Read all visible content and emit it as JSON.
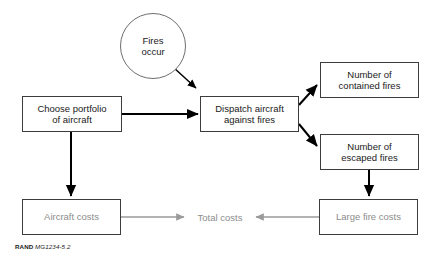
{
  "figure": {
    "caption_prefix": "RAND",
    "caption_id": "MG1234-5.2",
    "colors": {
      "box_border": "#3c3c3c",
      "circle_border": "#6e6e6e",
      "dark_text": "#1a1a1a",
      "gray_text": "#8c8c8c",
      "black_arrow": "#000000",
      "gray_arrow": "#9a9a9a",
      "background": "#ffffff"
    }
  },
  "nodes": {
    "fires_occur": {
      "label": "Fires\noccur",
      "line1": "Fires",
      "line2": "occur",
      "shape": "circle"
    },
    "choose_portfolio": {
      "line1": "Choose portfolio",
      "line2": "of aircraft",
      "shape": "box"
    },
    "dispatch_aircraft": {
      "line1": "Dispatch aircraft",
      "line2": "against fires",
      "shape": "box"
    },
    "contained_fires": {
      "line1": "Number of",
      "line2": "contained fires",
      "shape": "box"
    },
    "escaped_fires": {
      "line1": "Number of",
      "line2": "escaped fires",
      "shape": "box"
    },
    "aircraft_costs": {
      "line1": "Aircraft costs",
      "shape": "box"
    },
    "large_fire_costs": {
      "line1": "Large fire costs",
      "shape": "box"
    },
    "total_costs": {
      "line1": "Total costs",
      "shape": "plain-label"
    }
  },
  "edges": [
    {
      "from": "fires_occur",
      "to": "dispatch_aircraft",
      "style": "black-diagonal"
    },
    {
      "from": "choose_portfolio",
      "to": "dispatch_aircraft",
      "style": "black-horizontal"
    },
    {
      "from": "choose_portfolio",
      "to": "aircraft_costs",
      "style": "black-vertical"
    },
    {
      "from": "dispatch_aircraft",
      "to": "contained_fires",
      "style": "black-diagonal-up"
    },
    {
      "from": "dispatch_aircraft",
      "to": "escaped_fires",
      "style": "black-diagonal-down"
    },
    {
      "from": "escaped_fires",
      "to": "large_fire_costs",
      "style": "black-vertical"
    },
    {
      "from": "aircraft_costs",
      "to": "total_costs",
      "style": "gray-horizontal"
    },
    {
      "from": "large_fire_costs",
      "to": "total_costs",
      "style": "gray-horizontal-left"
    }
  ]
}
